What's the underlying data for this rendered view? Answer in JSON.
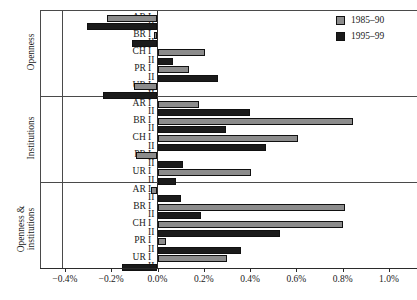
{
  "chart_data": {
    "type": "bar",
    "orientation": "horizontal",
    "title": "",
    "xlabel": "",
    "ylabel": "",
    "xlim": [
      -0.4,
      1.0
    ],
    "xticks": [
      -0.4,
      -0.2,
      0.0,
      0.2,
      0.4,
      0.6,
      0.8,
      1.0
    ],
    "xticklabels": [
      "-0.4%",
      "-0.2%",
      "0.0%",
      "0.2%",
      "0.4%",
      "0.6%",
      "0.8%",
      "1.0%"
    ],
    "grid": false,
    "legend_position": "top-right",
    "legend": [
      {
        "name": "1985–90",
        "color": "#8c8c8c"
      },
      {
        "name": "1995–99",
        "color": "#1b1b1b"
      }
    ],
    "series": [
      {
        "name": "1985–90",
        "color": "#8c8c8c"
      },
      {
        "name": "1995–99",
        "color": "#1b1b1b"
      }
    ],
    "panels": [
      {
        "label": "Openness",
        "label_lines": [
          "Openness"
        ],
        "rows": [
          {
            "country": "AR",
            "scenario": "I",
            "series": "1985–90",
            "value": -0.22
          },
          {
            "country": "AR",
            "scenario": "II",
            "series": "1995–99",
            "value": -0.305
          },
          {
            "country": "BR",
            "scenario": "I",
            "series": "1985–90",
            "value": -0.015
          },
          {
            "country": "BR",
            "scenario": "II",
            "series": "1995–99",
            "value": -0.11
          },
          {
            "country": "CH",
            "scenario": "I",
            "series": "1985–90",
            "value": 0.205
          },
          {
            "country": "CH",
            "scenario": "II",
            "series": "1995–99",
            "value": 0.065
          },
          {
            "country": "PR",
            "scenario": "I",
            "series": "1985–90",
            "value": 0.135
          },
          {
            "country": "PR",
            "scenario": "II",
            "series": "1995–99",
            "value": 0.26
          },
          {
            "country": "UR",
            "scenario": "I",
            "series": "1985–90",
            "value": -0.1
          },
          {
            "country": "UR",
            "scenario": "II",
            "series": "1995–99",
            "value": -0.235
          }
        ]
      },
      {
        "label": "Institutions",
        "label_lines": [
          "Institutions"
        ],
        "rows": [
          {
            "country": "AR",
            "scenario": "I",
            "series": "1985–90",
            "value": 0.18
          },
          {
            "country": "AR",
            "scenario": "II",
            "series": "1995–99",
            "value": 0.4
          },
          {
            "country": "BR",
            "scenario": "I",
            "series": "1985–90",
            "value": 0.845
          },
          {
            "country": "BR",
            "scenario": "II",
            "series": "1995–99",
            "value": 0.295
          },
          {
            "country": "CH",
            "scenario": "I",
            "series": "1985–90",
            "value": 0.605
          },
          {
            "country": "CH",
            "scenario": "II",
            "series": "1995–99",
            "value": 0.47
          },
          {
            "country": "PR",
            "scenario": "I",
            "series": "1985–90",
            "value": -0.095
          },
          {
            "country": "PR",
            "scenario": "II",
            "series": "1995–99",
            "value": 0.11
          },
          {
            "country": "UR",
            "scenario": "I",
            "series": "1985–90",
            "value": 0.405
          },
          {
            "country": "UR",
            "scenario": "II",
            "series": "1995–99",
            "value": 0.08
          }
        ]
      },
      {
        "label": "Openness & institutions",
        "label_lines": [
          "Openness &",
          "institutions"
        ],
        "rows": [
          {
            "country": "AR",
            "scenario": "I",
            "series": "1985–90",
            "value": -0.03
          },
          {
            "country": "AR",
            "scenario": "II",
            "series": "1995–99",
            "value": 0.1
          },
          {
            "country": "BR",
            "scenario": "I",
            "series": "1985–90",
            "value": 0.81
          },
          {
            "country": "BR",
            "scenario": "II",
            "series": "1995–99",
            "value": 0.19
          },
          {
            "country": "CH",
            "scenario": "I",
            "series": "1985–90",
            "value": 0.8
          },
          {
            "country": "CH",
            "scenario": "II",
            "series": "1995–99",
            "value": 0.53
          },
          {
            "country": "PR",
            "scenario": "I",
            "series": "1985–90",
            "value": 0.035
          },
          {
            "country": "PR",
            "scenario": "II",
            "series": "1995–99",
            "value": 0.36
          },
          {
            "country": "UR",
            "scenario": "I",
            "series": "1985–90",
            "value": 0.3
          },
          {
            "country": "UR",
            "scenario": "II",
            "series": "1995–99",
            "value": -0.155
          }
        ]
      }
    ]
  }
}
